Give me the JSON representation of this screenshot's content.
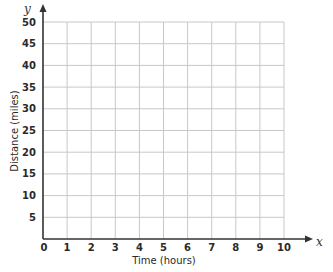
{
  "chart_data": {
    "type": "line",
    "title": "",
    "xlabel": "Time (hours)",
    "ylabel": "Distance (miles)",
    "x_axis_variable": "x",
    "y_axis_variable": "y",
    "xlim": [
      0,
      10
    ],
    "ylim": [
      0,
      50
    ],
    "x_ticks": [
      "0",
      "1",
      "2",
      "3",
      "4",
      "5",
      "6",
      "7",
      "8",
      "9",
      "10"
    ],
    "y_ticks": [
      "5",
      "10",
      "15",
      "20",
      "25",
      "30",
      "35",
      "40",
      "45",
      "50"
    ],
    "grid": true,
    "series": [],
    "legend": null
  },
  "colors": {
    "axis": "#333333",
    "grid": "#c8c8c8",
    "text": "#2a2a2a"
  }
}
